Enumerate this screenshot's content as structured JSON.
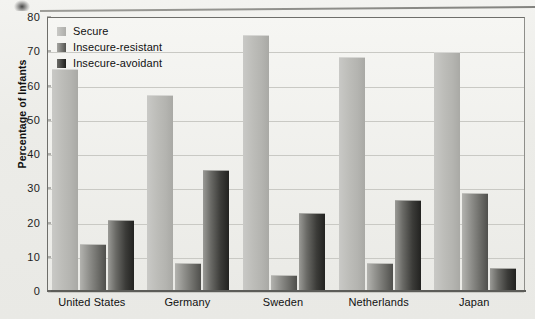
{
  "chart_data": {
    "type": "bar",
    "title": "",
    "xlabel": "",
    "ylabel": "Percentage of Infants",
    "ylim": [
      0,
      80
    ],
    "ytick_step": 10,
    "yticks": [
      0,
      10,
      20,
      30,
      40,
      50,
      60,
      70,
      80
    ],
    "grid": true,
    "legend_position": "top-left-inside",
    "categories": [
      "United States",
      "Germany",
      "Sweden",
      "Netherlands",
      "Japan"
    ],
    "series": [
      {
        "name": "Secure",
        "color": "#b8b8b4",
        "values": [
          65,
          57.5,
          75,
          68.5,
          70
        ]
      },
      {
        "name": "Insecure-resistant",
        "color": "#777773",
        "values": [
          14,
          8.5,
          5,
          8.5,
          29
        ]
      },
      {
        "name": "Insecure-avoidant",
        "color": "#2d2d2a",
        "values": [
          21,
          35.5,
          23,
          27,
          7
        ]
      }
    ]
  },
  "legend": {
    "items": [
      {
        "label": "Secure"
      },
      {
        "label": "Insecure-resistant"
      },
      {
        "label": "Insecure-avoidant"
      }
    ]
  },
  "axes": {
    "y_title": "Percentage of Infants"
  }
}
